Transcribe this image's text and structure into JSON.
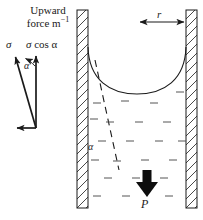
{
  "figure": {
    "background_color": "#ffffff",
    "stroke_color": "#1a1a1a",
    "width": 203,
    "height": 220
  },
  "vector_diagram": {
    "caption_line1": "Upward",
    "caption_line2_prefix": "force m",
    "caption_line2_sup": "−1",
    "sigma_label": "σ",
    "sigma_component_prefix": "σ",
    "sigma_component_rest": " cos α",
    "angle_label": "α",
    "vectors": [
      {
        "name": "sigma",
        "from": [
          36,
          128
        ],
        "to": [
          14,
          54
        ],
        "label": "σ"
      },
      {
        "name": "sigma-cos-alpha",
        "from": [
          36,
          128
        ],
        "to": [
          36,
          53
        ],
        "label": "σ cos α"
      },
      {
        "name": "horizontal-component",
        "from": [
          36,
          128
        ],
        "to": [
          14,
          128
        ],
        "label": ""
      }
    ]
  },
  "tube": {
    "left_wall": {
      "x": 77,
      "y": 10,
      "width": 11,
      "height": 198
    },
    "right_wall": {
      "x": 186,
      "y": 10,
      "width": 11,
      "height": 198
    },
    "hatch_spacing": 9,
    "radius_label": "r",
    "radius_arrow": {
      "from": [
        138,
        22
      ],
      "to": [
        186,
        22
      ]
    },
    "meniscus": {
      "left": [
        88,
        48
      ],
      "right": [
        186,
        48
      ],
      "bottom_y": 94,
      "shape": "concave"
    },
    "contact_angle_label": "α",
    "tangent_line": {
      "from": [
        95,
        62
      ],
      "to": [
        118,
        168
      ],
      "style": "dashed"
    },
    "pressure_label": "P",
    "pressure_arrow": {
      "from": [
        147,
        172
      ],
      "to": [
        147,
        196
      ],
      "direction": "down"
    },
    "liquid_marks_rows": 6
  }
}
